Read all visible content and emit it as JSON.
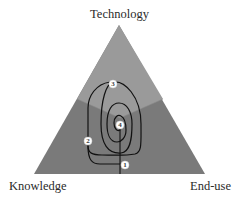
{
  "diagram": {
    "type": "triangle-spiral",
    "vertices": {
      "top": "Technology",
      "bottom_left": "Knowledge",
      "bottom_right": "End-use"
    },
    "regions": [
      {
        "name": "technology-region",
        "color": "#9a9a9a"
      },
      {
        "name": "knowledge-region",
        "color": "#7a7a7a"
      },
      {
        "name": "end-use-region",
        "color": "#7a7a7a"
      }
    ],
    "markers": [
      {
        "label": "1",
        "x": 125,
        "y": 165
      },
      {
        "label": "2",
        "x": 88,
        "y": 141
      },
      {
        "label": "3",
        "x": 113,
        "y": 84
      },
      {
        "label": "4",
        "x": 120,
        "y": 125
      }
    ],
    "colors": {
      "spiral_line": "#111111",
      "marker_fill": "#ffffff",
      "triangle_edge": "#6a6a6a"
    }
  }
}
